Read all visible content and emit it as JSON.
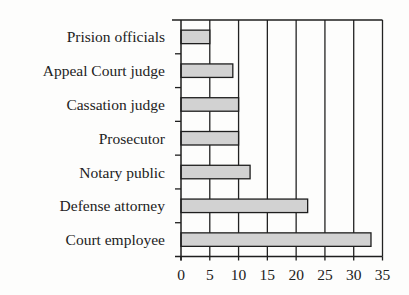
{
  "chart_data": {
    "type": "bar",
    "orientation": "horizontal",
    "title": "",
    "xlabel": "",
    "ylabel": "",
    "categories": [
      "Prision officials",
      "Appeal Court judge",
      "Cassation judge",
      "Prosecutor",
      "Notary public",
      "Defense attorney",
      "Court employee"
    ],
    "values": [
      5,
      9,
      10,
      10,
      12,
      22,
      33
    ],
    "xlim": [
      0,
      35
    ],
    "x_ticks": [
      0,
      5,
      10,
      15,
      20,
      25,
      30,
      35
    ],
    "x_tick_labels": [
      "0",
      "5",
      "10",
      "15",
      "20",
      "25",
      "30",
      "35"
    ],
    "grid": "vertical",
    "legend": "none",
    "colors": {
      "bar_fill": "#d2d2d2",
      "bar_outline": "#1e1e1e",
      "grid": "#222222",
      "text": "#222222"
    }
  }
}
